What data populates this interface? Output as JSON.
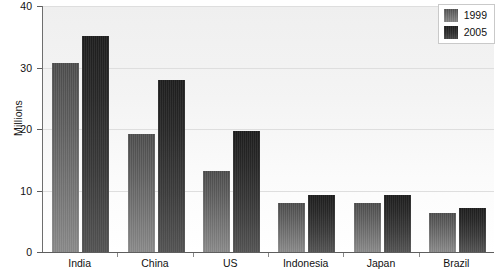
{
  "chart_data": {
    "type": "bar",
    "title": "",
    "subtitle": "",
    "xlabel": "",
    "ylabel": "Millions",
    "ylim": [
      0,
      40
    ],
    "yticks": [
      0,
      10,
      20,
      30,
      40
    ],
    "grid": true,
    "legend_position": "top-right",
    "categories": [
      "India",
      "China",
      "US",
      "Indonesia",
      "Japan",
      "Brazil"
    ],
    "series": [
      {
        "name": "1999",
        "color": "#6e6e6e",
        "values": [
          30.7,
          19.2,
          13.2,
          7.9,
          7.9,
          6.3
        ]
      },
      {
        "name": "2005",
        "color": "#2a2a2a",
        "values": [
          35.2,
          27.9,
          19.6,
          9.2,
          9.2,
          7.2
        ]
      }
    ]
  },
  "axis": {
    "y_title": "Millions",
    "y_tick_labels": [
      "40",
      "30",
      "20",
      "10",
      "0"
    ]
  },
  "legend": {
    "items": [
      {
        "label": "1999"
      },
      {
        "label": "2005"
      }
    ]
  }
}
